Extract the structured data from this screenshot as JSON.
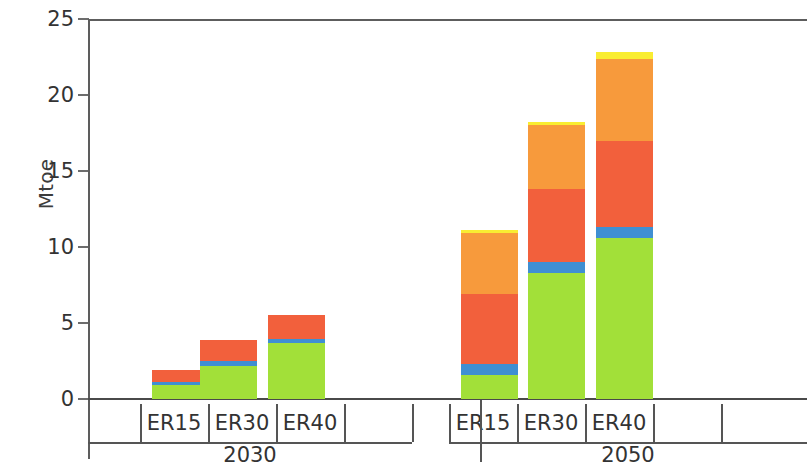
{
  "chart_data": {
    "type": "bar",
    "stacked": true,
    "title": "",
    "xlabel": "",
    "ylabel": "Mtoe",
    "ylim": [
      0,
      25
    ],
    "yticks": [
      0,
      5,
      10,
      15,
      20,
      25
    ],
    "ytick_labels": [
      "0",
      "5",
      "10",
      "15",
      "20",
      "25"
    ],
    "grid": false,
    "legend": "none",
    "categories": [
      "ER15",
      "ER30",
      "ER40",
      "ER15",
      "ER30",
      "ER40"
    ],
    "groups": [
      {
        "label": "2030",
        "categories": [
          "ER15",
          "ER30",
          "ER40"
        ]
      },
      {
        "label": "2050",
        "categories": [
          "ER15",
          "ER30",
          "ER40"
        ]
      }
    ],
    "series": [
      {
        "name": "green",
        "color": "#a2e039",
        "values": [
          0.9,
          2.2,
          3.7,
          1.6,
          8.3,
          10.6
        ]
      },
      {
        "name": "blue",
        "color": "#3f8fd2",
        "values": [
          0.25,
          0.3,
          0.25,
          0.7,
          0.7,
          0.7
        ]
      },
      {
        "name": "red",
        "color": "#f2603c",
        "values": [
          0.75,
          1.4,
          1.55,
          4.6,
          4.8,
          5.7
        ]
      },
      {
        "name": "orange",
        "color": "#f79a3c",
        "values": [
          0.0,
          0.0,
          0.0,
          4.0,
          4.2,
          5.4
        ]
      },
      {
        "name": "yellow",
        "color": "#f9ed32",
        "values": [
          0.0,
          0.0,
          0.0,
          0.2,
          0.2,
          0.4
        ]
      }
    ],
    "totals": [
      1.9,
      3.9,
      5.5,
      11.1,
      18.2,
      22.8
    ]
  },
  "axis": {
    "y_label": "Mtoe"
  }
}
